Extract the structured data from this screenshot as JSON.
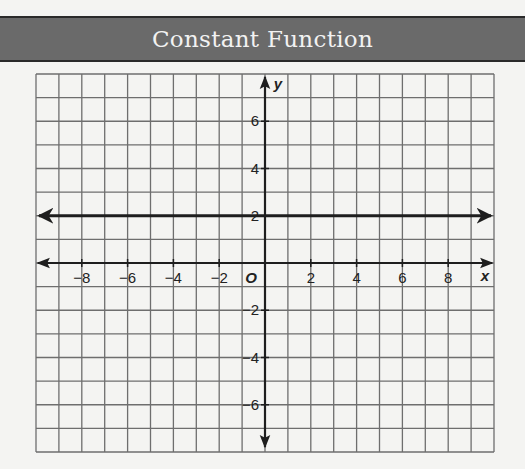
{
  "header": {
    "title": "Constant Function"
  },
  "colors": {
    "band": "#6a6a6a",
    "grid": "#6e6e6e",
    "axis": "#1e1e1e",
    "line": "#1e1e1e",
    "background": "#f4f4f2"
  },
  "chart_data": {
    "type": "line",
    "title": "Constant Function",
    "xlabel": "x",
    "ylabel": "y",
    "xlim": [
      -10,
      10
    ],
    "ylim": [
      -8,
      8
    ],
    "grid": true,
    "origin_label": "O",
    "x_ticks": [
      -8,
      -6,
      -4,
      -2,
      2,
      4,
      6,
      8
    ],
    "y_ticks": [
      6,
      4,
      2,
      -2,
      -4,
      -6
    ],
    "x_tick_labels": [
      "−8",
      "−6",
      "−4",
      "−2",
      "2",
      "4",
      "6",
      "8"
    ],
    "y_tick_labels": [
      "6",
      "4",
      "2",
      "−2",
      "−4",
      "−6"
    ],
    "series": [
      {
        "name": "y = 2",
        "equation": "y = 2",
        "x": [
          -10,
          10
        ],
        "y": [
          2,
          2
        ],
        "arrows_both_ends": true
      }
    ]
  }
}
